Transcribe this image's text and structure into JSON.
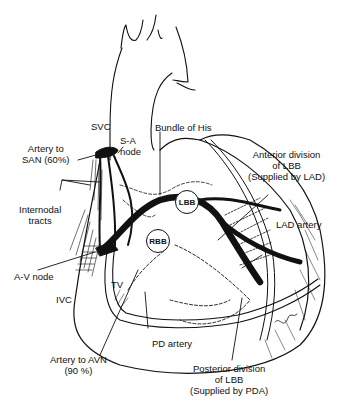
{
  "diagram": {
    "labels": {
      "svc": "SVC",
      "sa_node_line1": "S-A",
      "sa_node_line2": "node",
      "artery_to_san_line1": "Artery to",
      "artery_to_san_line2": "SAN (60%)",
      "bundle_of_his": "Bundle of His",
      "anterior_div_line1": "Anterior division",
      "anterior_div_line2": "of LBB",
      "anterior_div_line3": "(Supplied by LAD)",
      "internodal_line1": "Internodal",
      "internodal_line2": "tracts",
      "lbb": "LBB",
      "rbb": "RBB",
      "lad_artery": "LAD artery",
      "av_node": "A-V node",
      "ivc": "IVC",
      "tv": "TV",
      "pd_artery": "PD artery",
      "artery_to_avn_line1": "Artery to AVN",
      "artery_to_avn_line2": "(90 %)",
      "posterior_div_line1": "Posterior division",
      "posterior_div_line2": "of LBB",
      "posterior_div_line3": "(Supplied by PDA)"
    },
    "colors": {
      "ink": "#111111",
      "background": "#ffffff"
    }
  }
}
